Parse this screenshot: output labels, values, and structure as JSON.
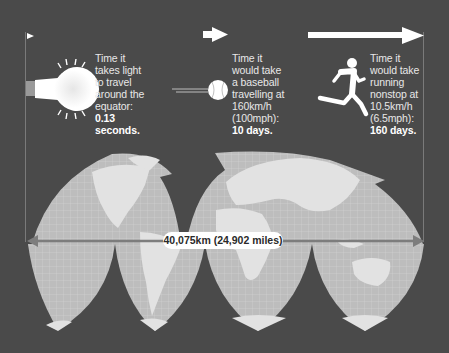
{
  "colors": {
    "background": "#4a4a4a",
    "land": "#dcdcdc",
    "ocean": "#b9b9b9",
    "grid": "#cfcfcf",
    "arrow": "#ffffff",
    "measure_line": "#7d7d7d",
    "text": "#e8e8e8"
  },
  "facts": [
    {
      "icon": "lightbulb-icon",
      "lines": [
        "Time it",
        "takes light",
        "to travel",
        "around the",
        "equator:"
      ],
      "highlight": [
        "0.13",
        "seconds."
      ]
    },
    {
      "icon": "baseball-icon",
      "lines": [
        "Time it",
        "would take",
        "a baseball",
        "travelling at",
        "160km/h",
        "(100mph):"
      ],
      "highlight": [
        "10 days."
      ]
    },
    {
      "icon": "runner-icon",
      "lines": [
        "Time it",
        "would take",
        "running",
        "nonstop at",
        "10.5km/h",
        "(6.5mph):"
      ],
      "highlight": [
        "160 days."
      ]
    }
  ],
  "map": {
    "measurement_label": "40,075km (24,902 miles)"
  }
}
